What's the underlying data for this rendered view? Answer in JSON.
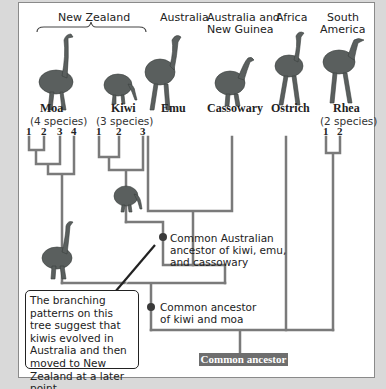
{
  "regions": {
    "new_zealand": "New Zealand",
    "australia": "Australia",
    "australia_ng_line1": "Australia and",
    "australia_ng_line2": "New Guinea",
    "africa": "Africa",
    "south_america_line1": "South",
    "south_america_line2": "America"
  },
  "taxa": [
    {
      "name": "Moa",
      "count": "(4 species)",
      "tips": [
        "1",
        "2",
        "3",
        "4"
      ]
    },
    {
      "name": "Kiwi",
      "count": "(3 species)",
      "tips": [
        "1",
        "2",
        "3"
      ]
    },
    {
      "name": "Emu"
    },
    {
      "name": "Cassowary"
    },
    {
      "name": "Ostrich"
    },
    {
      "name": "Rhea",
      "count": "(2 species)",
      "tips": [
        "1",
        "2"
      ]
    }
  ],
  "nodes": {
    "australian_ancestor": {
      "line1": "Common Australian",
      "line2": "ancestor of kiwi, emu,",
      "line3": "and cassowary"
    },
    "kiwi_moa_ancestor": {
      "line1": "Common ancestor",
      "line2": "of kiwi and moa"
    },
    "root": "Common ancestor"
  },
  "callout": {
    "text": "The branching patterns on this tree suggest that kiwis evolved in Australia and then moved to New Zealand at a later point."
  },
  "colors": {
    "branch": "#7a7a7a",
    "node": "#3a3a3a",
    "root_fill": "#6e6e6e",
    "bird": "#5a5f5e"
  }
}
